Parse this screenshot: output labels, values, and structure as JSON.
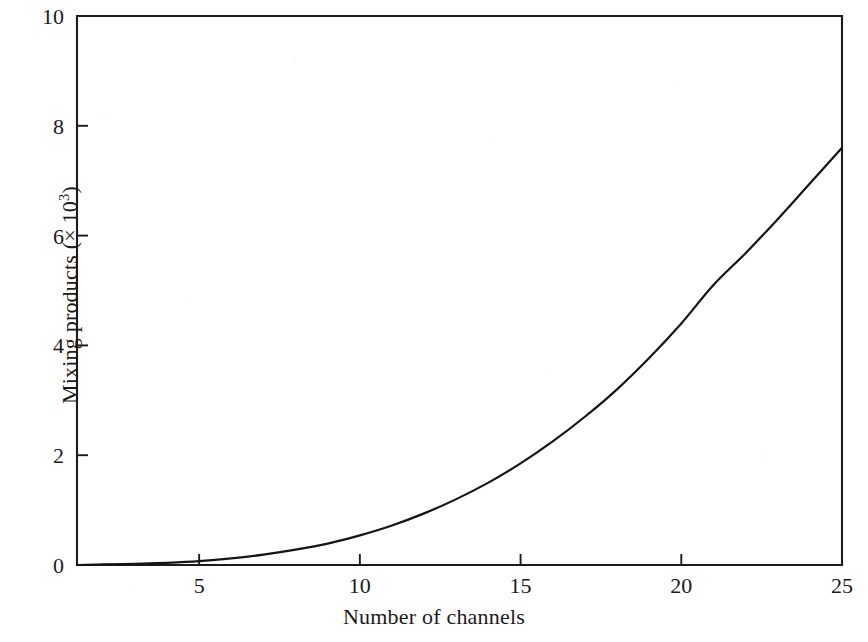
{
  "chart_data": {
    "type": "line",
    "title": "",
    "xlabel": "Number of channels",
    "ylabel_text": "Mixing products (× 10",
    "ylabel_exponent": "3",
    "ylabel_suffix": ")",
    "ylabel_full": "Mixing products (× 10³)",
    "xlim": [
      1.2,
      25
    ],
    "ylim": [
      0,
      10
    ],
    "xticks": [
      5,
      10,
      15,
      20,
      25
    ],
    "xtick_labels": [
      "5",
      "10",
      "15",
      "20",
      "25"
    ],
    "yticks": [
      0,
      2,
      4,
      6,
      8,
      10
    ],
    "ytick_labels": [
      "0",
      "2",
      "4",
      "6",
      "8",
      "10"
    ],
    "grid": false,
    "legend": null,
    "series": [
      {
        "name": "Mixing products",
        "x": [
          1.2,
          2,
          3,
          4,
          5,
          6,
          7,
          8,
          9,
          10,
          11,
          12,
          13,
          14,
          15,
          16,
          17,
          18,
          19,
          20,
          21,
          22,
          23,
          24,
          25
        ],
        "y": [
          0.0,
          0.01,
          0.02,
          0.04,
          0.07,
          0.12,
          0.19,
          0.28,
          0.39,
          0.54,
          0.72,
          0.94,
          1.2,
          1.5,
          1.85,
          2.25,
          2.7,
          3.2,
          3.77,
          4.4,
          5.1,
          5.68,
          6.3,
          6.95,
          7.6
        ]
      }
    ],
    "axis_color": "#1c1c1c",
    "curve_color": "#141414",
    "background": "#ffffff"
  },
  "figure": {
    "x_axis_title": "Number of channels",
    "y_axis_title_prefix": "Mixing products (× 10",
    "y_axis_title_exponent": "3",
    "y_axis_title_suffix": ")"
  }
}
